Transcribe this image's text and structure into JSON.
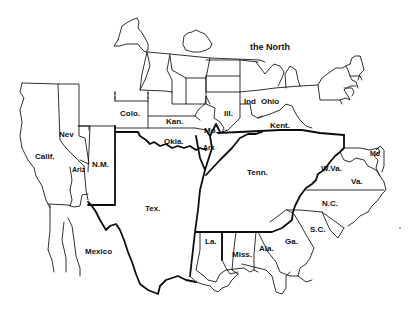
{
  "map": {
    "title": "",
    "background": "#ffffff",
    "line_color": "#111111",
    "regions": [
      {
        "id": "north",
        "label": "the North"
      },
      {
        "id": "colo",
        "label": "Colo."
      },
      {
        "id": "kan",
        "label": "Kan."
      },
      {
        "id": "nev",
        "label": "Nev"
      },
      {
        "id": "calif",
        "label": "Calif."
      },
      {
        "id": "ariz",
        "label": "Ariz"
      },
      {
        "id": "nm",
        "label": "N.M."
      },
      {
        "id": "okla",
        "label": "Okla."
      },
      {
        "id": "mo",
        "label": "Mo."
      },
      {
        "id": "ark",
        "label": "Ark"
      },
      {
        "id": "ill",
        "label": "Ill."
      },
      {
        "id": "ind",
        "label": "Ind"
      },
      {
        "id": "ohio",
        "label": "Ohio"
      },
      {
        "id": "kent",
        "label": "Kent."
      },
      {
        "id": "tenn",
        "label": "Tenn."
      },
      {
        "id": "wva",
        "label": "W.Va."
      },
      {
        "id": "md",
        "label": "Md"
      },
      {
        "id": "va",
        "label": "Va."
      },
      {
        "id": "nc",
        "label": "N.C."
      },
      {
        "id": "sc",
        "label": "S.C."
      },
      {
        "id": "ga",
        "label": "Ga."
      },
      {
        "id": "ala",
        "label": "Ala."
      },
      {
        "id": "miss",
        "label": "Miss."
      },
      {
        "id": "la",
        "label": "La."
      },
      {
        "id": "tex",
        "label": "Tex."
      },
      {
        "id": "mexico",
        "label": "Mexico"
      }
    ]
  }
}
